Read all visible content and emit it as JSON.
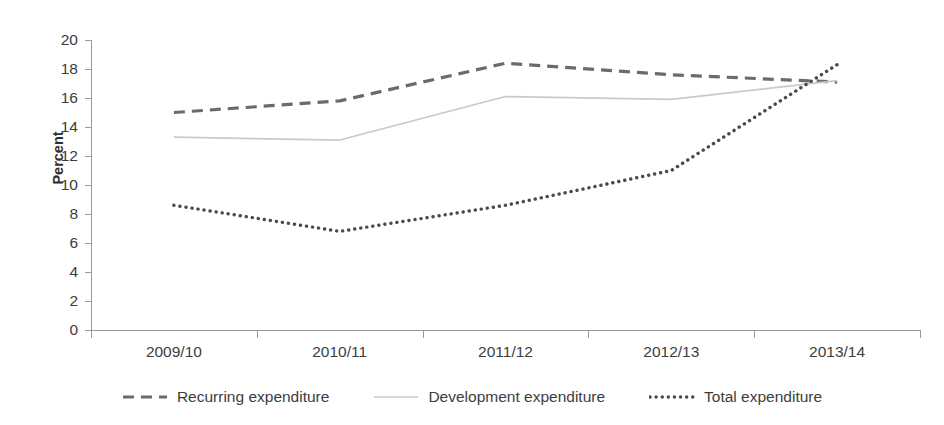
{
  "chart_data": {
    "type": "line",
    "title": "Figure 4: Education expenditure as a share of total government expenditure",
    "xlabel": "",
    "ylabel": "Percent",
    "categories": [
      "2009/10",
      "2010/11",
      "2011/12",
      "2012/13",
      "2013/14"
    ],
    "ylim": [
      0,
      20
    ],
    "ytick_step": 2,
    "yticks": [
      "20",
      "18",
      "16",
      "14",
      "12",
      "10",
      "8",
      "6",
      "4",
      "2",
      "0"
    ],
    "grid": false,
    "legend_position": "bottom",
    "series": [
      {
        "name": "Recurring expenditure",
        "style": "dashed",
        "color": "#6b6b6b",
        "values": [
          15.0,
          15.8,
          18.4,
          17.6,
          17.1
        ]
      },
      {
        "name": "Development expenditure",
        "style": "solid",
        "color": "#c9c9c9",
        "values": [
          13.3,
          13.1,
          16.1,
          15.9,
          17.2
        ]
      },
      {
        "name": "Total expenditure",
        "style": "dotted",
        "color": "#4a4a4a",
        "values": [
          8.6,
          6.8,
          8.6,
          11.0,
          18.3
        ]
      }
    ]
  },
  "axis": {
    "y_title": "Percent"
  },
  "colors": {
    "axis": "#9a9a9a",
    "text": "#3d3d3d",
    "recurring": "#6b6b6b",
    "development": "#c9c9c9",
    "total": "#4a4a4a",
    "background": "#ffffff"
  }
}
